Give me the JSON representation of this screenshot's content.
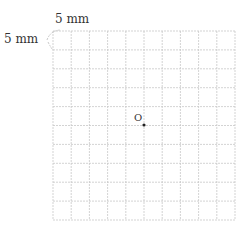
{
  "diagram": {
    "top_label": "5 mm",
    "left_label": "5 mm",
    "grid": {
      "cols": 10,
      "rows": 10,
      "x": 53,
      "y": 31,
      "width": 182,
      "height": 189,
      "line_color": "#c8c8c8"
    },
    "point_label": "O",
    "point": {
      "x": 144,
      "y": 125
    }
  }
}
